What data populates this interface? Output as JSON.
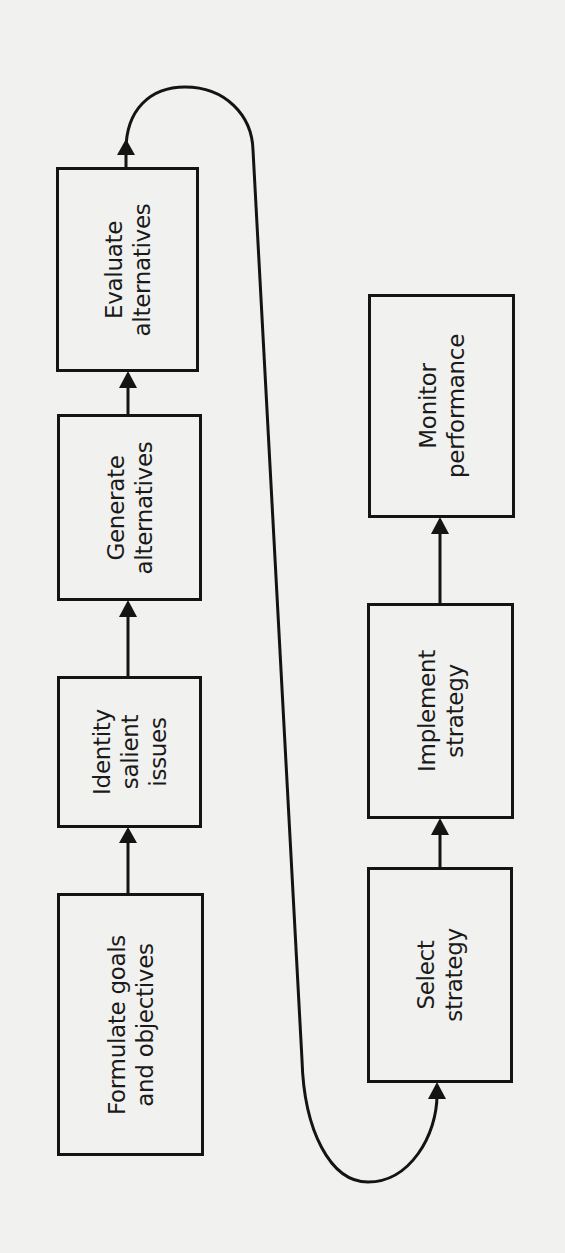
{
  "diagram": {
    "type": "strategic-planning-flowchart",
    "orientation": "rotated-90-ccw",
    "colors": {
      "paper": "#f1f1ef",
      "ink": "#141414"
    },
    "left_column": [
      {
        "id": "formulate",
        "lines": [
          "Formulate goals",
          "and objectives"
        ]
      },
      {
        "id": "identify",
        "lines": [
          "Identity",
          "salient",
          "issues"
        ]
      },
      {
        "id": "generate",
        "lines": [
          "Generate",
          "alternatives"
        ]
      },
      {
        "id": "evaluate",
        "lines": [
          "Evaluate",
          "alternatives"
        ]
      }
    ],
    "right_column": [
      {
        "id": "select",
        "lines": [
          "Select",
          "strategy"
        ]
      },
      {
        "id": "implement",
        "lines": [
          "Implement",
          "strategy"
        ]
      },
      {
        "id": "monitor",
        "lines": [
          "Monitor",
          "performance"
        ]
      }
    ],
    "flow": [
      "Formulate goals and objectives",
      "Identity salient issues",
      "Generate alternatives",
      "Evaluate alternatives",
      "Select strategy",
      "Implement strategy",
      "Monitor performance"
    ]
  },
  "bleed_through_text": "sources should be deployed within organisational structures and what competitive advantages the firm needs to develop. In a multi-business company the second level decision involves determining the critical success requirements of each business unit or industry sector. At the third level functional strategy addresses other issues pertaining to research and development, product development and marketing. In approaching the process of planning, the overall strategy ..."
}
